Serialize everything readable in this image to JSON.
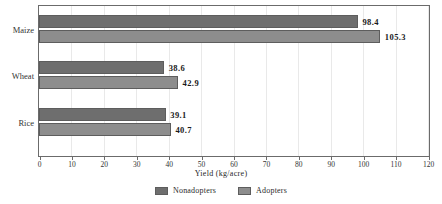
{
  "chart_data": {
    "type": "bar",
    "orientation": "horizontal",
    "title": "",
    "xlabel": "Yield (kg/acre)",
    "ylabel": "",
    "categories": [
      "Maize",
      "Wheat",
      "Rice"
    ],
    "series": [
      {
        "name": "Nonadopters",
        "color": "#6e6e6e",
        "values": [
          98.4,
          38.6,
          39.1
        ]
      },
      {
        "name": "Adopters",
        "color": "#8d8d8d",
        "values": [
          105.3,
          42.9,
          40.7
        ]
      }
    ],
    "data_labels": {
      "Maize": {
        "Nonadopters": "98.4",
        "Adopters": "105.3"
      },
      "Wheat": {
        "Nonadopters": "38.6",
        "Adopters": "42.9"
      },
      "Rice": {
        "Nonadopters": "39.1",
        "Adopters": "40.7"
      }
    },
    "xlim": [
      0,
      120
    ],
    "xticks": [
      0,
      10,
      20,
      30,
      40,
      50,
      60,
      70,
      80,
      90,
      100,
      110,
      120
    ],
    "xtick_labels": [
      "0",
      "10",
      "20",
      "30",
      "40",
      "50",
      "60",
      "70",
      "80",
      "90",
      "100",
      "110",
      "120"
    ],
    "grid": true,
    "grid_axis": "x",
    "legend_position": "bottom"
  },
  "axis": {
    "x_title": "Yield (kg/acre)",
    "ticks": [
      "0",
      "10",
      "20",
      "30",
      "40",
      "50",
      "60",
      "70",
      "80",
      "90",
      "100",
      "110",
      "120"
    ],
    "categories": [
      "Maize",
      "Wheat",
      "Rice"
    ]
  },
  "legend": {
    "items": [
      {
        "label": "Nonadopters",
        "color": "#6e6e6e"
      },
      {
        "label": "Adopters",
        "color": "#8d8d8d"
      }
    ]
  },
  "bars": [
    {
      "category": "Maize",
      "series": "Nonadopters",
      "value": 98.4,
      "label": "98.4"
    },
    {
      "category": "Maize",
      "series": "Adopters",
      "value": 105.3,
      "label": "105.3"
    },
    {
      "category": "Wheat",
      "series": "Nonadopters",
      "value": 38.6,
      "label": "38.6"
    },
    {
      "category": "Wheat",
      "series": "Adopters",
      "value": 42.9,
      "label": "42.9"
    },
    {
      "category": "Rice",
      "series": "Nonadopters",
      "value": 39.1,
      "label": "39.1"
    },
    {
      "category": "Rice",
      "series": "Adopters",
      "value": 40.7,
      "label": "40.7"
    }
  ]
}
